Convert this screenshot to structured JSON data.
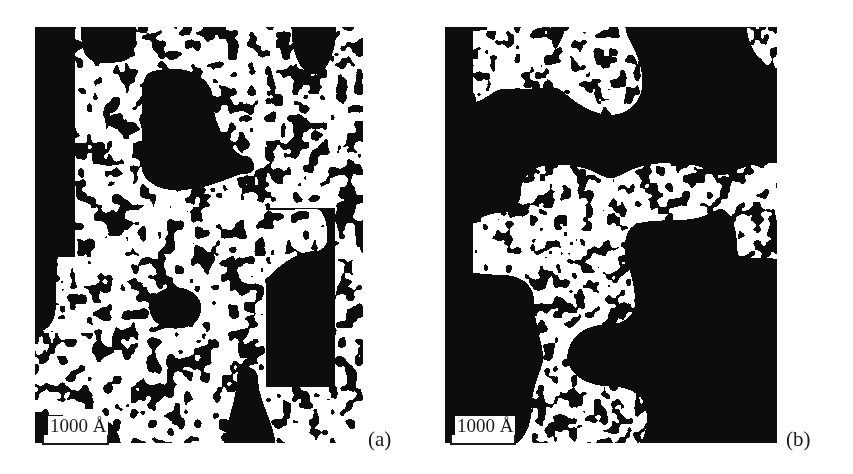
{
  "figure": {
    "panels": [
      {
        "id": "a",
        "label": "(a)",
        "scale_bar": {
          "text": "1000 Å"
        },
        "description": "binary microstructure, fine interconnected domains"
      },
      {
        "id": "b",
        "label": "(b)",
        "scale_bar": {
          "text": "1000 Å"
        },
        "description": "binary microstructure, coarsened domains"
      }
    ],
    "colors": {
      "foreground": "#0d0d0d",
      "background": "#ffffff"
    }
  }
}
